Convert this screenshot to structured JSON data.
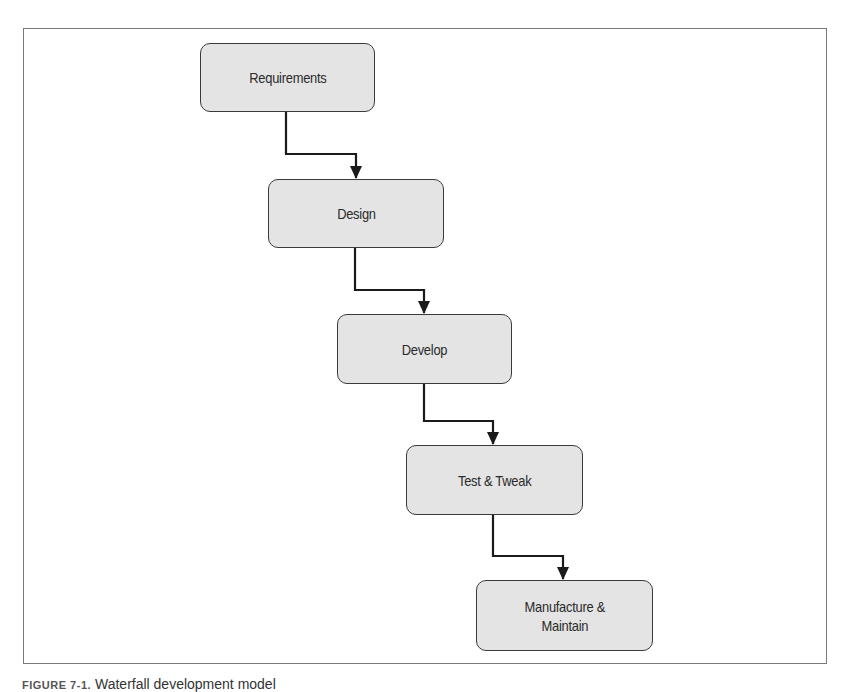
{
  "diagram": {
    "steps": [
      {
        "label": "Requirements"
      },
      {
        "label": "Design"
      },
      {
        "label": "Develop"
      },
      {
        "label": "Test & Tweak"
      },
      {
        "label": "Manufacture &\nMaintain"
      }
    ],
    "colors": {
      "box_fill": "#e4e4e4",
      "box_border": "#3a3a3a",
      "arrow": "#1a1a1a",
      "frame": "#7a7a7a"
    }
  },
  "caption": {
    "figure_label": "FIGURE 7-1.",
    "text": "Waterfall development model"
  }
}
